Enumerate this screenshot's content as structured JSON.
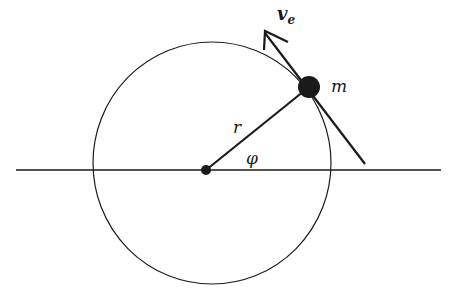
{
  "diagram": {
    "labels": {
      "velocity": "v",
      "velocity_subscript": "e",
      "mass": "m",
      "radius": "r",
      "angle": "φ"
    },
    "colors": {
      "stroke": "#1a1a1a",
      "background": "#ffffff"
    }
  }
}
